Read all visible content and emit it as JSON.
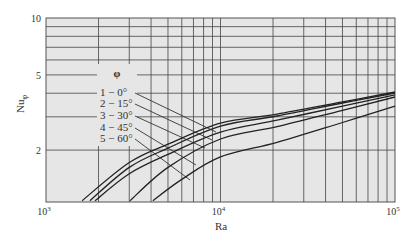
{
  "chart_data": {
    "type": "line",
    "title": "",
    "xlabel": "Ra",
    "ylabel": "Nu_φ",
    "xscale": "log",
    "yscale": "log",
    "xlim": [
      1000,
      100000
    ],
    "ylim": [
      1.07,
      10
    ],
    "grid": true,
    "x_tick_labels": [
      {
        "value": 1000,
        "base": "10",
        "exp": "3"
      },
      {
        "value": 10000,
        "base": "10",
        "exp": "4"
      },
      {
        "value": 100000,
        "base": "10",
        "exp": "5"
      }
    ],
    "y_tick_labels": [
      {
        "value": 10,
        "label": "10"
      },
      {
        "value": 5,
        "label": "5"
      },
      {
        "value": 2,
        "label": "2"
      }
    ],
    "legend_title": "φ",
    "legend_position": "inside upper-left",
    "series": [
      {
        "name": "1 − 0°",
        "x": [
          1610,
          3000,
          5000,
          10000,
          21100,
          50000,
          100000
        ],
        "y": [
          1.08,
          1.72,
          2.15,
          2.78,
          3.1,
          3.6,
          4.06
        ]
      },
      {
        "name": "2 − 15°",
        "x": [
          1785,
          3000,
          5000,
          10000,
          21100,
          50000,
          100000
        ],
        "y": [
          1.08,
          1.62,
          2.05,
          2.68,
          3.03,
          3.55,
          4.01
        ]
      },
      {
        "name": "3 − 30°",
        "x": [
          1910,
          3000,
          5000,
          10000,
          21100,
          50000,
          100000
        ],
        "y": [
          1.08,
          1.5,
          1.9,
          2.49,
          2.88,
          3.42,
          3.92
        ]
      },
      {
        "name": "4 − 45°",
        "x": [
          3030,
          5000,
          10000,
          21100,
          50000,
          100000
        ],
        "y": [
          1.08,
          1.62,
          2.29,
          2.66,
          3.25,
          3.82
        ]
      },
      {
        "name": "5 − 60°",
        "x": [
          4100,
          6000,
          10000,
          21100,
          50000,
          100000
        ],
        "y": [
          1.08,
          1.4,
          1.84,
          2.2,
          2.8,
          3.42
        ]
      }
    ]
  }
}
